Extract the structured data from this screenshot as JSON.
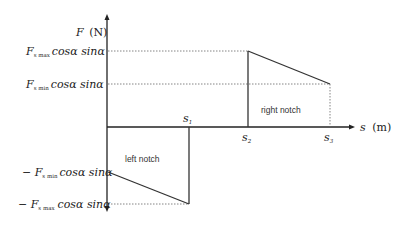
{
  "diagram": {
    "type": "force-displacement",
    "y_axis": {
      "symbol": "F",
      "unit": "(N)"
    },
    "x_axis": {
      "symbol": "s",
      "unit": "(m)"
    },
    "y_ticks": {
      "pos_max": {
        "prefix": "",
        "F": "F",
        "sub": "s max",
        "rest": "cosα sinα"
      },
      "pos_min": {
        "prefix": "",
        "F": "F",
        "sub": "s min",
        "rest": "cosα sinα"
      },
      "neg_min": {
        "prefix": "− ",
        "F": "F",
        "sub": "s min",
        "rest": "cosα sinα"
      },
      "neg_max": {
        "prefix": "− ",
        "F": "F",
        "sub": "s max",
        "rest": "cosα sinα"
      }
    },
    "x_ticks": {
      "s1": {
        "s": "s",
        "sub": "1"
      },
      "s2": {
        "s": "s",
        "sub": "2"
      },
      "s3": {
        "s": "s",
        "sub": "3"
      }
    },
    "regions": {
      "left": "left notch",
      "right": "right notch"
    },
    "colors": {
      "line": "#333333",
      "dotted": "#666666"
    }
  }
}
